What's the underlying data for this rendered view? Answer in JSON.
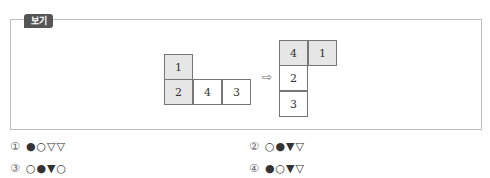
{
  "box": {
    "label": "보기",
    "figure_left": {
      "cells": [
        {
          "value": "1",
          "shaded": true,
          "x": 164,
          "y": 54
        },
        {
          "value": "2",
          "shaded": true,
          "x": 164,
          "y": 79
        },
        {
          "value": "4",
          "shaded": false,
          "x": 193,
          "y": 79
        },
        {
          "value": "3",
          "shaded": false,
          "x": 222,
          "y": 79
        }
      ]
    },
    "arrow": "⇨",
    "figure_right": {
      "cells": [
        {
          "value": "4",
          "shaded": true,
          "x": 279,
          "y": 40
        },
        {
          "value": "1",
          "shaded": true,
          "x": 308,
          "y": 40
        },
        {
          "value": "2",
          "shaded": false,
          "x": 279,
          "y": 65
        },
        {
          "value": "3",
          "shaded": false,
          "x": 279,
          "y": 91
        }
      ]
    }
  },
  "choices": [
    {
      "number": "①",
      "symbols": "●○▽▽"
    },
    {
      "number": "②",
      "symbols": "○●▼▽"
    },
    {
      "number": "③",
      "symbols": "○●▼○"
    },
    {
      "number": "④",
      "symbols": "●○▼▽"
    }
  ]
}
